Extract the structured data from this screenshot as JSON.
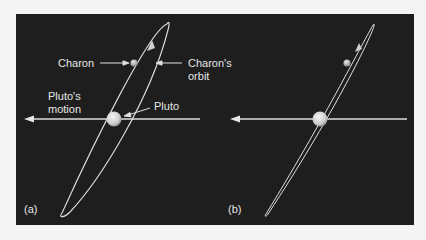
{
  "figure": {
    "background": "#1e1e1e",
    "page_background": "#f4f4f4",
    "line_color": "#e0e0e0",
    "panels": [
      {
        "id": "a",
        "label": "(a)",
        "labels": {
          "charon": "Charon",
          "charons_orbit_line1": "Charon's",
          "charons_orbit_line2": "orbit",
          "plutos_motion_line1": "Pluto's",
          "plutos_motion_line2": "motion",
          "pluto": "Pluto"
        },
        "description": "Charon's orbit shown as an inclined ellipse around Pluto; Pluto's motion arrow points left"
      },
      {
        "id": "b",
        "label": "(b)",
        "description": "Same system viewed nearly edge-on; orbit appears as a narrow ellipse"
      }
    ]
  }
}
